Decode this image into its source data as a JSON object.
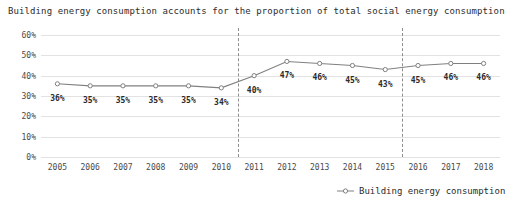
{
  "chart_data": {
    "type": "line",
    "title": "Building energy consumption accounts for the proportion of total social energy consumption",
    "xlabel": "",
    "ylabel": "",
    "categories": [
      "2005",
      "2006",
      "2007",
      "2008",
      "2009",
      "2010",
      "2011",
      "2012",
      "2013",
      "2014",
      "2015",
      "2016",
      "2017",
      "2018"
    ],
    "values": [
      36,
      35,
      35,
      35,
      35,
      34,
      40,
      47,
      46,
      45,
      43,
      45,
      46,
      46
    ],
    "data_labels": [
      "36%",
      "35%",
      "35%",
      "35%",
      "35%",
      "34%",
      "40%",
      "47%",
      "46%",
      "45%",
      "43%",
      "45%",
      "46%",
      "46%"
    ],
    "ylim": [
      0,
      60
    ],
    "ytick_labels": [
      "60%",
      "50%",
      "40%",
      "30%",
      "20%",
      "10%",
      "0%"
    ],
    "ytick_values": [
      60,
      50,
      40,
      30,
      20,
      10,
      0
    ],
    "grid": true,
    "legend_position": "bottom-right",
    "series": [
      {
        "name": "Building energy consumption",
        "values": [
          36,
          35,
          35,
          35,
          35,
          34,
          40,
          47,
          46,
          45,
          43,
          45,
          46,
          46
        ],
        "color": "#808080",
        "marker": "open-circle"
      }
    ],
    "annotations": {
      "divider_lines": [
        {
          "name": "divider-after-2010",
          "between": [
            "2010",
            "2011"
          ],
          "style": "dashed"
        },
        {
          "name": "divider-after-2015",
          "between": [
            "2015",
            "2016"
          ],
          "style": "dashed"
        }
      ]
    },
    "colors": {
      "line": "#808080",
      "gridline": "#e2e2e2",
      "divider": "#8d8d8d",
      "text": "#2b2b2b",
      "background": "#ffffff"
    }
  },
  "legend": {
    "label": "Building energy consumption"
  }
}
